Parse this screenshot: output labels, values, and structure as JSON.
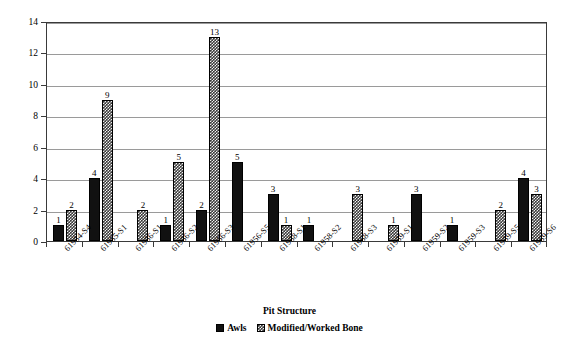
{
  "chart_data": {
    "type": "bar",
    "title": "",
    "xlabel": "Pit Structure",
    "ylabel": "Quantity",
    "ylim": [
      0,
      14
    ],
    "ytick_step": 2,
    "yticks": [
      0,
      2,
      4,
      6,
      8,
      10,
      12,
      14
    ],
    "grid": true,
    "legend_position": "bottom",
    "categories": [
      "61954-S4",
      "61955-S1",
      "61956-S1",
      "61956-S2",
      "61956-S3",
      "61956-S5",
      "61958-S1",
      "61958-S2",
      "61958-S3",
      "61959-S1",
      "61959-S2",
      "61959-S3",
      "61959-S5",
      "61959-S6"
    ],
    "series": [
      {
        "name": "Awls",
        "fill": "solid-black",
        "color": "#111111",
        "values": [
          1,
          4,
          0,
          1,
          2,
          5,
          3,
          1,
          0,
          0,
          3,
          1,
          0,
          4
        ]
      },
      {
        "name": "Modified/Worked Bone",
        "fill": "checkered",
        "color": "#3a3a3a",
        "values": [
          2,
          9,
          2,
          5,
          13,
          0,
          1,
          0,
          3,
          1,
          0,
          0,
          2,
          3
        ]
      }
    ],
    "data_labels": {
      "Awls": [
        "1",
        "4",
        "",
        "1",
        "2",
        "5",
        "3",
        "1",
        "",
        "",
        "3",
        "1",
        "",
        "4"
      ],
      "Modified/Worked Bone": [
        "2",
        "9",
        "2",
        "5",
        "13",
        "",
        "1",
        "",
        "3",
        "1",
        "",
        "",
        "2",
        "3"
      ]
    }
  },
  "legend": {
    "items": [
      {
        "label": "Awls",
        "swatch": "solid-black-swatch"
      },
      {
        "label": "Modified/Worked Bone",
        "swatch": "checkered-swatch"
      }
    ]
  },
  "axes": {
    "y_title": "Quantity",
    "x_title": "Pit Structure"
  }
}
